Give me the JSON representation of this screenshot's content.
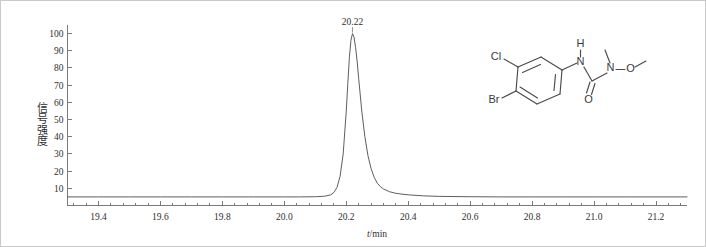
{
  "figure": {
    "background_color": "#ffffff",
    "border_color": "#c9c9c9",
    "axis_color": "#6d6d6d",
    "trace_color": "#555555",
    "structure_color": "#4a4a4a"
  },
  "chart_data": {
    "type": "line",
    "title": "",
    "subtitle": "",
    "xlabel": "t/min",
    "xlabel_italic_part": "t",
    "xlabel_rest": "/min",
    "ylabel": "信号强度",
    "xlim": [
      19.3,
      21.3
    ],
    "ylim": [
      0,
      105
    ],
    "grid": false,
    "legend": "none",
    "x_ticks": [
      "19.4",
      "19.6",
      "19.8",
      "20.0",
      "20.2",
      "20.4",
      "20.6",
      "20.8",
      "21.0",
      "21.2"
    ],
    "x_tick_values": [
      19.4,
      19.6,
      19.8,
      20.0,
      20.2,
      20.4,
      20.6,
      20.8,
      21.0,
      21.2
    ],
    "x_minor_per_major": 4,
    "y_ticks": [
      "10",
      "20",
      "30",
      "40",
      "50",
      "60",
      "70",
      "80",
      "90",
      "100"
    ],
    "y_tick_values": [
      10,
      20,
      30,
      40,
      50,
      60,
      70,
      80,
      90,
      100
    ],
    "annotations": [
      {
        "text": "20.22",
        "x": 20.22,
        "y": 100,
        "name": "peak-retention-time-label"
      }
    ],
    "series": [
      {
        "name": "chromatogram",
        "baseline": 5,
        "peaks": [
          {
            "retention_time": 20.22,
            "height": 100,
            "width_half_max": 0.032,
            "tail_factor": 2.6
          }
        ],
        "x": [
          19.3,
          19.4,
          19.5,
          19.6,
          19.7,
          19.8,
          19.9,
          20.0,
          20.05,
          20.1,
          20.13,
          20.15,
          20.16,
          20.17,
          20.18,
          20.19,
          20.2,
          20.205,
          20.21,
          20.215,
          20.22,
          20.225,
          20.23,
          20.235,
          20.24,
          20.25,
          20.26,
          20.27,
          20.28,
          20.29,
          20.3,
          20.31,
          20.32,
          20.34,
          20.36,
          20.38,
          20.4,
          20.45,
          20.5,
          20.6,
          20.7,
          20.8,
          20.9,
          21.0,
          21.1,
          21.2,
          21.3
        ],
        "y": [
          5.0,
          5.0,
          5.0,
          5.0,
          5.0,
          5.0,
          5.0,
          5.0,
          5.0,
          5.1,
          5.4,
          6.2,
          7.6,
          10.5,
          17.0,
          30.0,
          55.0,
          71.0,
          86.0,
          96.0,
          100.0,
          98.0,
          92.0,
          84.0,
          74.0,
          55.0,
          40.0,
          29.0,
          21.5,
          16.5,
          13.0,
          11.0,
          9.6,
          8.0,
          7.1,
          6.6,
          6.2,
          5.6,
          5.3,
          5.1,
          5.0,
          5.0,
          5.0,
          5.0,
          5.0,
          5.0,
          5.0
        ]
      }
    ]
  },
  "structure": {
    "name": "chlorbromuron",
    "atom_labels": [
      {
        "text": "Cl",
        "name": "atom-label-chlorine"
      },
      {
        "text": "Br",
        "name": "atom-label-bromine"
      },
      {
        "text": "H",
        "name": "atom-label-amide-hydrogen"
      },
      {
        "text": "N",
        "name": "atom-label-amide-nitrogen"
      },
      {
        "text": "O",
        "name": "atom-label-carbonyl-oxygen"
      },
      {
        "text": "N",
        "name": "atom-label-methoxy-nitrogen"
      },
      {
        "text": "O",
        "name": "atom-label-methoxy-oxygen"
      }
    ]
  }
}
